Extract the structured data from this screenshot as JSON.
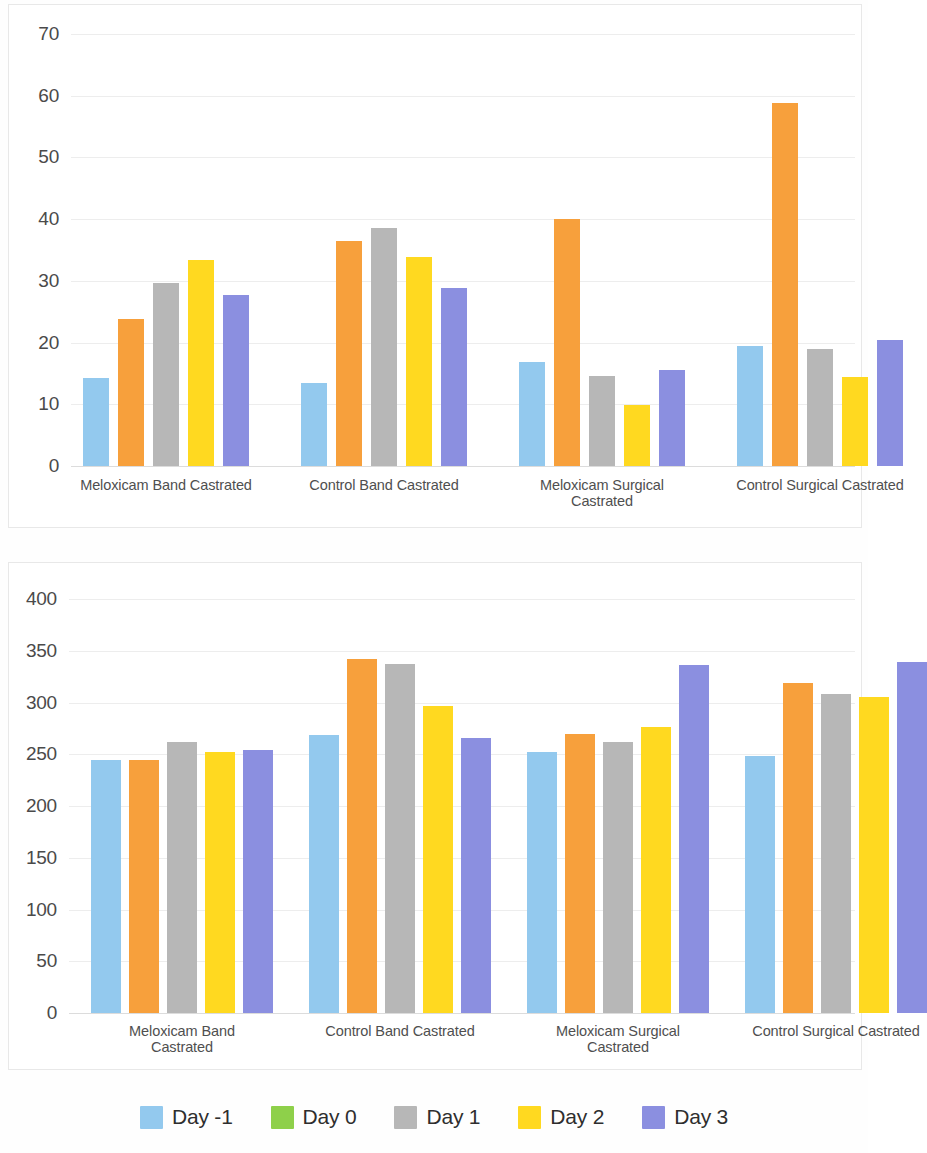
{
  "legend": {
    "position": "bottom",
    "items": [
      {
        "label": "Day -1",
        "color": "#93c9ee"
      },
      {
        "label": "Day 0",
        "color": "#8ed04a"
      },
      {
        "label": "Day 1",
        "color": "#b7b7b7"
      },
      {
        "label": "Day 2",
        "color": "#ffd920"
      },
      {
        "label": "Day 3",
        "color": "#8b8fe0"
      }
    ]
  },
  "charts": [
    {
      "id": "chart-top",
      "type": "bar",
      "title": "",
      "xlabel": "",
      "ylabel": "",
      "ylim": [
        0,
        70
      ],
      "yticks": [
        0,
        10,
        20,
        30,
        40,
        50,
        60,
        70
      ],
      "grid": true,
      "groups": [
        {
          "line1": "Meloxicam Band Castrated",
          "line2": ""
        },
        {
          "line1": "Control Band Castrated",
          "line2": ""
        },
        {
          "line1": "Meloxicam Surgical",
          "line2": "Castrated"
        },
        {
          "line1": "Control Surgical Castrated",
          "line2": ""
        }
      ],
      "categories": [
        "Meloxicam Band Castrated",
        "Control Band Castrated",
        "Meloxicam Surgical Castrated",
        "Control Surgical Castrated"
      ],
      "series": [
        {
          "name": "Day -1",
          "color": "#93c9ee",
          "values": [
            14.2,
            13.4,
            16.8,
            19.4
          ]
        },
        {
          "name": "Day 0",
          "color": "#f7a03c",
          "values": [
            23.9,
            36.4,
            40.0,
            58.8
          ]
        },
        {
          "name": "Day 1",
          "color": "#b7b7b7",
          "values": [
            29.7,
            38.6,
            14.6,
            18.9
          ]
        },
        {
          "name": "Day 2",
          "color": "#ffd920",
          "values": [
            33.4,
            33.8,
            9.9,
            14.4
          ]
        },
        {
          "name": "Day 3",
          "color": "#8b8fe0",
          "values": [
            27.7,
            28.9,
            15.5,
            20.4
          ]
        }
      ]
    },
    {
      "id": "chart-bottom",
      "type": "bar",
      "title": "",
      "xlabel": "",
      "ylabel": "",
      "ylim": [
        0,
        400
      ],
      "yticks": [
        0,
        50,
        100,
        150,
        200,
        250,
        300,
        350,
        400
      ],
      "grid": true,
      "groups": [
        {
          "line1": "Meloxicam Band",
          "line2": "Castrated"
        },
        {
          "line1": "Control Band Castrated",
          "line2": ""
        },
        {
          "line1": "Meloxicam Surgical",
          "line2": "Castrated"
        },
        {
          "line1": "Control Surgical Castrated",
          "line2": ""
        }
      ],
      "categories": [
        "Meloxicam Band Castrated",
        "Control Band Castrated",
        "Meloxicam Surgical Castrated",
        "Control Surgical Castrated"
      ],
      "series": [
        {
          "name": "Day -1",
          "color": "#93c9ee",
          "values": [
            244,
            269,
            252,
            248
          ]
        },
        {
          "name": "Day 0",
          "color": "#f7a03c",
          "values": [
            244,
            342,
            270,
            319
          ]
        },
        {
          "name": "Day 1",
          "color": "#b7b7b7",
          "values": [
            262,
            337,
            262,
            308
          ]
        },
        {
          "name": "Day 2",
          "color": "#ffd920",
          "values": [
            252,
            297,
            276,
            305
          ]
        },
        {
          "name": "Day 3",
          "color": "#8b8fe0",
          "values": [
            254,
            266,
            336,
            339
          ]
        }
      ]
    }
  ],
  "chart_data": [
    {
      "type": "bar",
      "title": "",
      "xlabel": "",
      "ylabel": "",
      "ylim": [
        0,
        70
      ],
      "grid": true,
      "legend_position": "bottom",
      "categories": [
        "Meloxicam Band Castrated",
        "Control Band Castrated",
        "Meloxicam Surgical Castrated",
        "Control Surgical Castrated"
      ],
      "tick_labels": [
        0,
        10,
        20,
        30,
        40,
        50,
        60,
        70
      ],
      "series": [
        {
          "name": "Day -1",
          "values": [
            14.2,
            13.4,
            16.8,
            19.4
          ]
        },
        {
          "name": "Day 0",
          "values": [
            23.9,
            36.4,
            40.0,
            58.8
          ]
        },
        {
          "name": "Day 1",
          "values": [
            29.7,
            38.6,
            14.6,
            18.9
          ]
        },
        {
          "name": "Day 2",
          "values": [
            33.4,
            33.8,
            9.9,
            14.4
          ]
        },
        {
          "name": "Day 3",
          "values": [
            27.7,
            28.9,
            15.5,
            20.4
          ]
        }
      ]
    },
    {
      "type": "bar",
      "title": "",
      "xlabel": "",
      "ylabel": "",
      "ylim": [
        0,
        400
      ],
      "grid": true,
      "legend_position": "bottom",
      "categories": [
        "Meloxicam Band Castrated",
        "Control Band Castrated",
        "Meloxicam Surgical Castrated",
        "Control Surgical Castrated"
      ],
      "tick_labels": [
        0,
        50,
        100,
        150,
        200,
        250,
        300,
        350,
        400
      ],
      "series": [
        {
          "name": "Day -1",
          "values": [
            244,
            269,
            252,
            248
          ]
        },
        {
          "name": "Day 0",
          "values": [
            244,
            342,
            270,
            319
          ]
        },
        {
          "name": "Day 1",
          "values": [
            262,
            337,
            262,
            308
          ]
        },
        {
          "name": "Day 2",
          "values": [
            252,
            297,
            276,
            305
          ]
        },
        {
          "name": "Day 3",
          "values": [
            254,
            266,
            336,
            339
          ]
        }
      ]
    }
  ]
}
